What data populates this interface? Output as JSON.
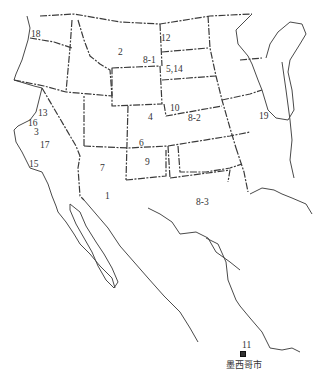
{
  "map": {
    "region": "Western and Central United States with northern Mexico",
    "colors": {
      "border": "#3a3a3a",
      "coast": "#4a4a4a",
      "background": "#ffffff",
      "text": "#333333"
    },
    "labels": [
      {
        "id": "18",
        "text": "18",
        "x": 31,
        "y": 30
      },
      {
        "id": "2",
        "text": "2",
        "x": 118,
        "y": 48
      },
      {
        "id": "12",
        "text": "12",
        "x": 161,
        "y": 34
      },
      {
        "id": "8-1",
        "text": "8-1",
        "x": 143,
        "y": 56
      },
      {
        "id": "5,14",
        "text": "5,14",
        "x": 166,
        "y": 65
      },
      {
        "id": "10",
        "text": "10",
        "x": 170,
        "y": 104
      },
      {
        "id": "8-2",
        "text": "8-2",
        "x": 188,
        "y": 114
      },
      {
        "id": "19",
        "text": "19",
        "x": 259,
        "y": 112
      },
      {
        "id": "4",
        "text": "4",
        "x": 148,
        "y": 113
      },
      {
        "id": "6",
        "text": "6",
        "x": 139,
        "y": 139
      },
      {
        "id": "9",
        "text": "9",
        "x": 145,
        "y": 158
      },
      {
        "id": "13",
        "text": "13",
        "x": 38,
        "y": 109
      },
      {
        "id": "16",
        "text": "16",
        "x": 28,
        "y": 119
      },
      {
        "id": "3",
        "text": "3",
        "x": 34,
        "y": 128
      },
      {
        "id": "17",
        "text": "17",
        "x": 40,
        "y": 141
      },
      {
        "id": "15",
        "text": "15",
        "x": 29,
        "y": 160
      },
      {
        "id": "7",
        "text": "7",
        "x": 100,
        "y": 164
      },
      {
        "id": "1",
        "text": "1",
        "x": 105,
        "y": 192
      },
      {
        "id": "8-3",
        "text": "8-3",
        "x": 196,
        "y": 198
      },
      {
        "id": "11",
        "text": "11",
        "x": 242,
        "y": 341
      }
    ],
    "city": {
      "name": "墨西哥市",
      "marker": "square-marker",
      "x": 241,
      "y": 348
    }
  }
}
